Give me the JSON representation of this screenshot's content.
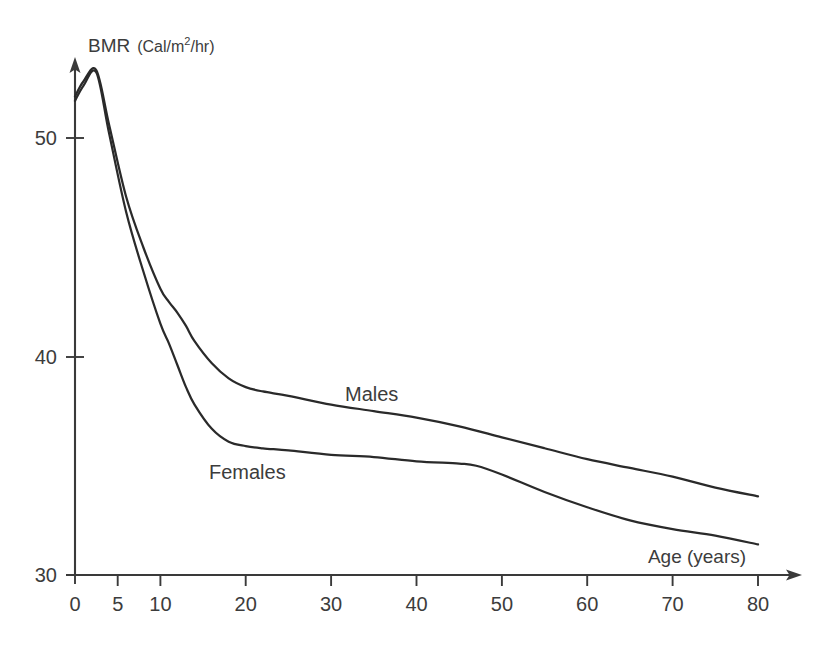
{
  "chart_data": {
    "type": "line",
    "title": "",
    "xlabel": "Age (years)",
    "ylabel": "BMR (Cal/m2/hr)",
    "ylabel_main": "BMR",
    "ylabel_unit_prefix": "(Cal/m",
    "ylabel_unit_sup": "2",
    "ylabel_unit_suffix": "/hr)",
    "xlim": [
      0,
      80
    ],
    "ylim": [
      30,
      53.5
    ],
    "grid": false,
    "legend_position": "inline-annotation",
    "xticks": [
      0,
      5,
      10,
      20,
      30,
      40,
      50,
      60,
      70,
      80
    ],
    "xticklabels": [
      "0",
      "5",
      "10",
      "20",
      "30",
      "40",
      "50",
      "60",
      "70",
      "80"
    ],
    "yticks": [
      30,
      40,
      50
    ],
    "yticklabels": [
      "30",
      "40",
      "50"
    ],
    "annotations": [
      {
        "text": "Males",
        "x": 32,
        "y": 39.8
      },
      {
        "text": "Females",
        "x": 16,
        "y": 36.5
      },
      {
        "text": "Age (years)",
        "x": 72,
        "y": 31.6
      }
    ],
    "series": [
      {
        "name": "Males",
        "label": "Males",
        "color": "#2a2a2a",
        "x": [
          0,
          1,
          2.5,
          4,
          6,
          8,
          10,
          11,
          12,
          13,
          14,
          16,
          18,
          20,
          22,
          25,
          30,
          35,
          40,
          45,
          50,
          55,
          60,
          65,
          70,
          75,
          80
        ],
        "values": [
          51.9,
          52.6,
          53.1,
          50.6,
          47.3,
          45.0,
          43.1,
          42.5,
          42.0,
          41.4,
          40.7,
          39.7,
          39.0,
          38.6,
          38.4,
          38.2,
          37.8,
          37.5,
          37.2,
          36.8,
          36.3,
          35.8,
          35.3,
          34.9,
          34.5,
          34.0,
          33.6
        ]
      },
      {
        "name": "Females",
        "label": "Females",
        "color": "#2a2a2a",
        "x": [
          0,
          1,
          2.5,
          4,
          6,
          8,
          10,
          11,
          12,
          13,
          14,
          16,
          18,
          20,
          22,
          25,
          30,
          35,
          40,
          45,
          47,
          50,
          55,
          60,
          65,
          70,
          75,
          80
        ],
        "values": [
          51.7,
          52.4,
          53.0,
          50.2,
          46.6,
          43.9,
          41.5,
          40.6,
          39.6,
          38.6,
          37.8,
          36.7,
          36.1,
          35.9,
          35.8,
          35.7,
          35.5,
          35.4,
          35.2,
          35.1,
          35.0,
          34.6,
          33.8,
          33.1,
          32.5,
          32.1,
          31.8,
          31.4
        ]
      }
    ]
  }
}
